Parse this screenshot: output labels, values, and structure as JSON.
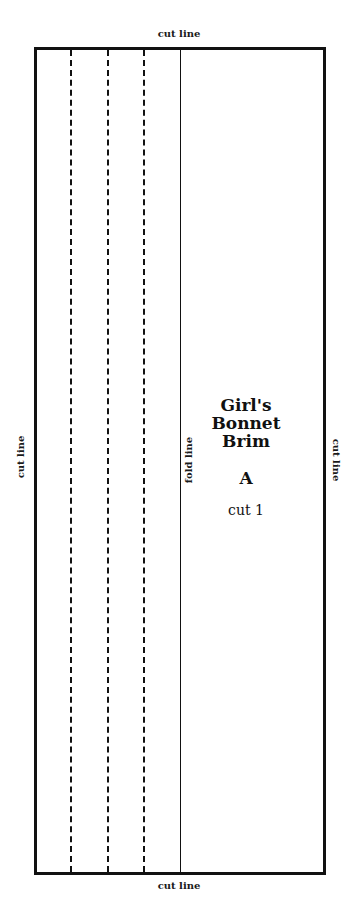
{
  "labels": {
    "top": "cut line",
    "bottom": "cut line",
    "left": "cut line",
    "right": "cut line",
    "fold": "fold line"
  },
  "pattern": {
    "title_lines": [
      "Girl's",
      "Bonnet",
      "Brim"
    ],
    "piece_letter": "A",
    "cut_instruction": "cut 1",
    "dashed_line_count": 3,
    "colors": {
      "line": "#111111",
      "background": "#ffffff"
    }
  }
}
